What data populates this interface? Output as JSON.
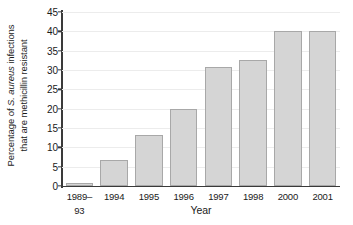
{
  "chart_data": {
    "type": "bar",
    "title": "",
    "xlabel": "Year",
    "ylabel_lines": [
      "Percentage of S. aureus infections",
      "that are methicillin resistant"
    ],
    "ylabel_italic_part": "S. aureus",
    "ylabel_prefix": "Percentage of ",
    "ylabel_suffix": " infections",
    "ylabel_line2": "that are methicillin resistant",
    "categories": [
      "1989–93",
      "1994",
      "1995",
      "1996",
      "1997",
      "1998",
      "2000",
      "2001"
    ],
    "values": [
      0.7,
      6.7,
      13.1,
      20.0,
      30.7,
      32.5,
      40.0,
      40.0
    ],
    "ylim": [
      0,
      45
    ],
    "yticks": [
      0,
      5,
      10,
      15,
      20,
      25,
      30,
      35,
      40,
      45
    ],
    "ytick_labels": [
      "0",
      "5",
      "10",
      "15",
      "20",
      "25",
      "30",
      "35",
      "40",
      "45"
    ],
    "grid": "horizontal",
    "legend": "none",
    "bar_fill_color": "#d5d5d5",
    "bar_border_color": "#a8a8a8",
    "gridline_color": "#ececec",
    "axis_color": "#3a3a3a",
    "background_color": "#ffffff"
  }
}
